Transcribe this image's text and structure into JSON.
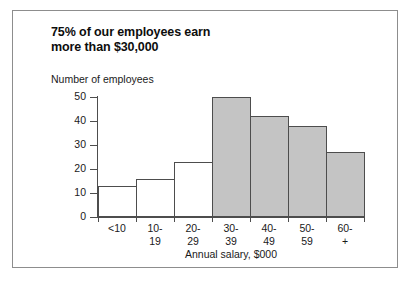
{
  "title": {
    "line1": "75% of our employees earn",
    "line2": "more than $30,000"
  },
  "axis_title_y": "Number of employees",
  "axis_title_x": "Annual salary, $000",
  "colors": {
    "bar_fill_highlight": "#c4c4c4",
    "bar_fill_plain": "#ffffff",
    "bar_stroke": "#4d4d4d",
    "frame": "#8d8d8d",
    "text": "#1a1a1a"
  },
  "chart_data": {
    "type": "bar",
    "title": "75% of our employees earn more than $30,000",
    "xlabel": "Annual salary, $000",
    "ylabel": "Number of employees",
    "ylim": [
      0,
      50
    ],
    "yticks": [
      0,
      10,
      20,
      30,
      40,
      50
    ],
    "grid": false,
    "legend": "none",
    "categories": [
      "<10",
      "10-19",
      "20-29",
      "30-39",
      "40-49",
      "50-59",
      "60-+"
    ],
    "category_lines": [
      [
        "<10",
        ""
      ],
      [
        "10-",
        "19"
      ],
      [
        "20-",
        "29"
      ],
      [
        "30-",
        "39"
      ],
      [
        "40-",
        "49"
      ],
      [
        "50-",
        "59"
      ],
      [
        "60-",
        "+"
      ]
    ],
    "values": [
      13,
      16,
      23,
      50,
      42,
      38,
      27
    ],
    "bar_styles": [
      "plain",
      "plain",
      "plain",
      "highlight",
      "highlight",
      "highlight",
      "highlight"
    ]
  }
}
